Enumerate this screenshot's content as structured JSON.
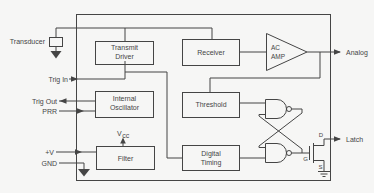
{
  "colors": {
    "background": "#f6f6f5",
    "line": "#454545",
    "text": "#454545"
  },
  "pins": {
    "transducer": "Transducer",
    "trig_in": "Trig In",
    "trig_out": "Trig Out",
    "prr": "PRR",
    "v_plus": "+V",
    "gnd": "GND",
    "analog": "Analog",
    "latch": "Latch"
  },
  "blocks": {
    "transmit_driver": [
      "Transmit",
      "Driver"
    ],
    "receiver": "Receiver",
    "ac_amp": [
      "AC",
      "AMP"
    ],
    "internal_oscillator": [
      "Internal",
      "Oscillator"
    ],
    "threshold": "Threshold",
    "digital_timing": [
      "Digital",
      "Timing"
    ],
    "filter": "Filter"
  },
  "net_labels": {
    "vcc_main": "V",
    "vcc_sub": "cc",
    "drain": "D",
    "gate": "G",
    "source": "S"
  }
}
